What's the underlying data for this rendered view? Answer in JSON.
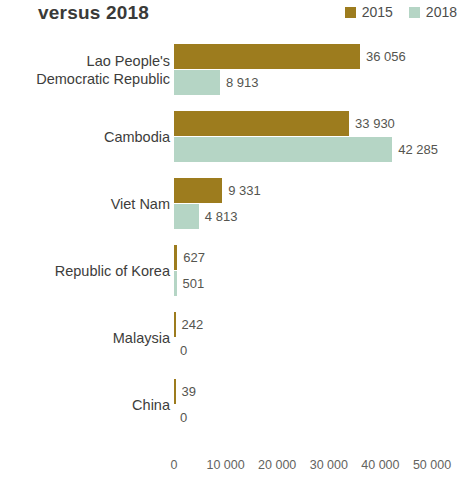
{
  "header": {
    "title": "versus 2018"
  },
  "legend": {
    "position": "top-right",
    "entries": [
      {
        "label": "2015",
        "color": "#9d7c1e",
        "swatch_name": "legend-swatch-2015"
      },
      {
        "label": "2018",
        "color": "#b5d5c5",
        "swatch_name": "legend-swatch-2018"
      }
    ]
  },
  "colors": {
    "series_2015": "#9d7c1e",
    "series_2018": "#b5d5c5",
    "label_text": "#3d3d3b",
    "value_text": "#55554f",
    "axis_text": "#636360",
    "title_text": "#3a3a38",
    "background": "#ffffff"
  },
  "chart_data": {
    "type": "bar",
    "orientation": "horizontal",
    "title": "versus 2018",
    "xlabel": "",
    "ylabel": "",
    "xlim": [
      0,
      50000
    ],
    "grid": false,
    "legend_position": "top-right",
    "xticks": [
      0,
      10000,
      20000,
      30000,
      40000,
      50000
    ],
    "xtick_labels": [
      "0",
      "10 000",
      "20 000",
      "30 000",
      "40 000",
      "50 000"
    ],
    "categories": [
      "Lao People's\nDemocratic Republic",
      "Cambodia",
      "Viet Nam",
      "Republic of Korea",
      "Malaysia",
      "China"
    ],
    "series": [
      {
        "name": "2015",
        "color": "#9d7c1e",
        "values": [
          36056,
          33930,
          9331,
          627,
          242,
          39
        ],
        "value_labels": [
          "36 056",
          "33 930",
          "9 331",
          "627",
          "242",
          "39"
        ]
      },
      {
        "name": "2018",
        "color": "#b5d5c5",
        "values": [
          8913,
          42285,
          4813,
          501,
          0,
          0
        ],
        "value_labels": [
          "8 913",
          "42 285",
          "4 813",
          "501",
          "0",
          "0"
        ]
      }
    ]
  }
}
